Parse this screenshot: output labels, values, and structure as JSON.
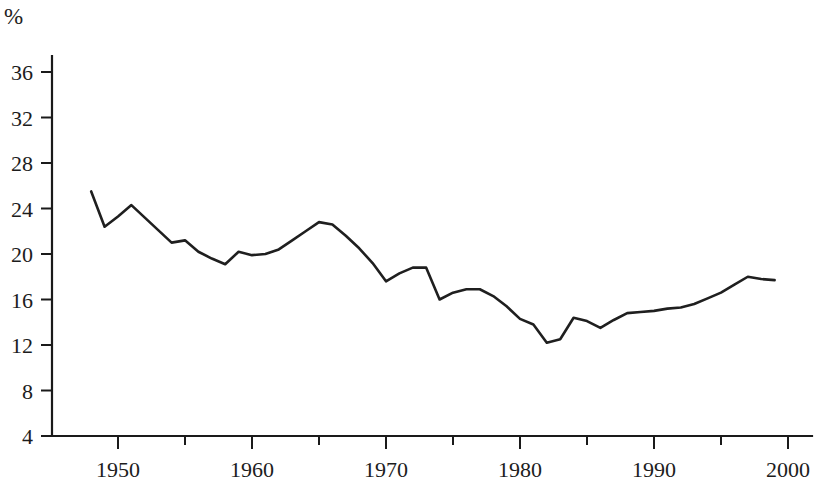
{
  "chart_data": {
    "type": "line",
    "title": "",
    "subtitle": "",
    "xlabel": "",
    "ylabel": "%",
    "unit_label": "%",
    "grid": false,
    "legend": "none",
    "xlim": [
      1947,
      2000
    ],
    "ylim": [
      4,
      36
    ],
    "x_ticks_major": [
      1950,
      1960,
      1970,
      1980,
      1990,
      2000
    ],
    "x_ticks_minor": [
      1955,
      1965,
      1975,
      1985,
      1995
    ],
    "x_tick_labels": [
      "1950",
      "1960",
      "1970",
      "1980",
      "1990",
      "2000"
    ],
    "y_ticks": [
      4,
      8,
      12,
      16,
      20,
      24,
      28,
      32,
      36
    ],
    "y_tick_labels": [
      "4",
      "8",
      "12",
      "16",
      "20",
      "24",
      "28",
      "32",
      "36"
    ],
    "series": [
      {
        "name": "share",
        "x": [
          1948,
          1949,
          1950,
          1951,
          1952,
          1953,
          1954,
          1955,
          1956,
          1957,
          1958,
          1959,
          1960,
          1961,
          1962,
          1963,
          1964,
          1965,
          1966,
          1967,
          1968,
          1969,
          1970,
          1971,
          1972,
          1973,
          1974,
          1975,
          1976,
          1977,
          1978,
          1979,
          1980,
          1981,
          1982,
          1983,
          1984,
          1985,
          1986,
          1987,
          1988,
          1989,
          1990,
          1991,
          1992,
          1993,
          1994,
          1995,
          1996,
          1997,
          1998,
          1999
        ],
        "values": [
          25.5,
          22.4,
          23.3,
          24.3,
          23.2,
          22.1,
          21.0,
          21.2,
          20.2,
          19.6,
          19.1,
          20.2,
          19.9,
          20.0,
          20.4,
          21.2,
          22.0,
          22.8,
          22.6,
          21.6,
          20.5,
          19.2,
          17.6,
          18.3,
          18.8,
          18.8,
          16.0,
          16.6,
          16.9,
          16.9,
          16.3,
          15.4,
          14.3,
          13.8,
          12.2,
          12.5,
          14.4,
          14.1,
          13.5,
          14.2,
          14.8,
          14.9,
          15.0,
          15.2,
          15.3,
          15.6,
          16.1,
          16.6,
          17.3,
          18.0,
          17.8,
          17.7
        ]
      }
    ]
  },
  "axes": {
    "y_axis_name": "percent-axis",
    "x_axis_name": "year-axis"
  }
}
